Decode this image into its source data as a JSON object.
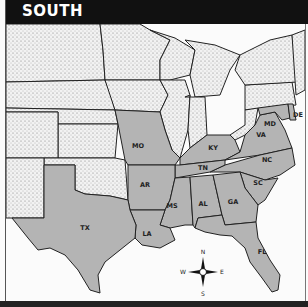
{
  "header": {
    "title": "SOUTH"
  },
  "colors": {
    "header_bg": "#111111",
    "south_fill": "#b4b4b4",
    "other_fill": "#ececec",
    "water": "#fbfbfb",
    "border": "#222222"
  },
  "states": {
    "highlighted": [
      {
        "abbr": "MO",
        "x": 138,
        "y": 146
      },
      {
        "abbr": "KY",
        "x": 213,
        "y": 148
      },
      {
        "abbr": "MD",
        "x": 270,
        "y": 124
      },
      {
        "abbr": "DE",
        "x": 297,
        "y": 115
      },
      {
        "abbr": "VA",
        "x": 261,
        "y": 135
      },
      {
        "abbr": "NC",
        "x": 267,
        "y": 160
      },
      {
        "abbr": "TN",
        "x": 203,
        "y": 168
      },
      {
        "abbr": "SC",
        "x": 258,
        "y": 183
      },
      {
        "abbr": "AR",
        "x": 145,
        "y": 185
      },
      {
        "abbr": "MS",
        "x": 172,
        "y": 206
      },
      {
        "abbr": "AL",
        "x": 203,
        "y": 204
      },
      {
        "abbr": "GA",
        "x": 233,
        "y": 202
      },
      {
        "abbr": "TX",
        "x": 85,
        "y": 228
      },
      {
        "abbr": "LA",
        "x": 147,
        "y": 234
      },
      {
        "abbr": "FL",
        "x": 262,
        "y": 252
      }
    ]
  },
  "compass": {
    "n": "N",
    "s": "S",
    "e": "E",
    "w": "W"
  }
}
